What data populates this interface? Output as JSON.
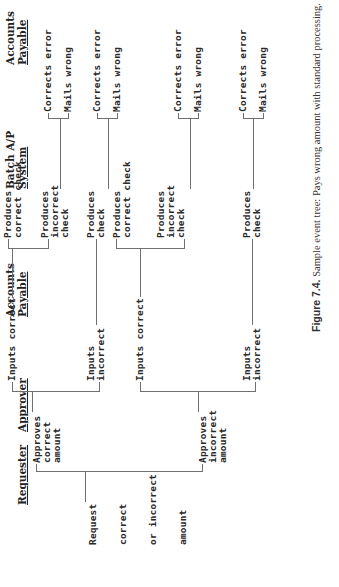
{
  "figure": {
    "headers": {
      "requester": "Requester",
      "approver": "Approver",
      "ap1_line1": "Accounts",
      "ap1_line2": "Payable",
      "batch_line1": "Batch A/P",
      "batch_line2": "System",
      "ap2_line1": "Accounts",
      "ap2_line2": "Payable"
    },
    "root": {
      "line1": "Request",
      "line2": "correct",
      "line3": "or incorrect",
      "line4": "amount"
    },
    "approver": {
      "correct": "Approves\ncorrect\namount",
      "incorrect": "Approves\nincorrect\namount"
    },
    "ap_inputs": {
      "a_correct": "Inputs correct",
      "a_incorrect": "Inputs\nincorrect",
      "b_correct": "Inputs correct",
      "b_incorrect": "Inputs\nincorrect"
    },
    "batch": {
      "a1": "Produces\ncorrect check",
      "a2": "Produces\nincorrect\ncheck",
      "a3": "Produces\ncheck",
      "b1": "Produces\ncorrect check",
      "b2": "Produces\nincorrect\ncheck",
      "b3": "Produces\ncheck"
    },
    "ap_outcomes": {
      "o1_corrects": "Corrects error",
      "o1_mails": "Mails wrong",
      "o2_corrects": "Corrects error",
      "o2_mails": "Mails wrong",
      "o3_corrects": "Corrects error",
      "o3_mails": "Mails wrong",
      "o4_corrects": "Corrects error",
      "o4_mails": "Mails wrong"
    },
    "caption": {
      "label": "Figure 7.4.",
      "text": " Sample event tree: Pays wrong amount with standard processing."
    }
  }
}
